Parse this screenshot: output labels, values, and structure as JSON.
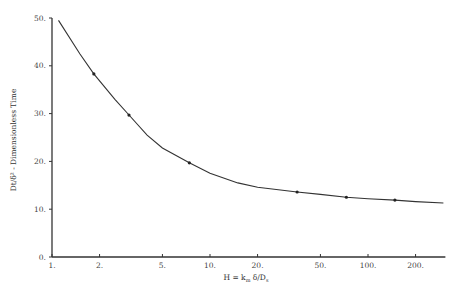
{
  "chart_data": {
    "type": "line",
    "title": "",
    "xlabel": "H = k_m δ/D_s",
    "ylabel": "Dt/δ² - Dimensionless Time",
    "xscale": "log",
    "xlim": [
      1,
      300
    ],
    "ylim": [
      0,
      50
    ],
    "x_ticks": [
      "1.",
      "2.",
      "5.",
      "10.",
      "20.",
      "50.",
      "100.",
      "200."
    ],
    "y_ticks": [
      "0.",
      "10.",
      "20.",
      "30.",
      "40.",
      "50."
    ],
    "grid": false,
    "legend": null,
    "series": [
      {
        "name": "fitted curve",
        "style": "line",
        "x": [
          1.1,
          1.5,
          1.84,
          2.5,
          3.07,
          4.0,
          5.0,
          7.4,
          10,
          15,
          20,
          35.6,
          50,
          73,
          100,
          148,
          200,
          300
        ],
        "y": [
          49.5,
          42.5,
          38.3,
          33.0,
          29.7,
          25.5,
          22.8,
          19.7,
          17.5,
          15.5,
          14.6,
          13.6,
          13.1,
          12.5,
          12.2,
          11.9,
          11.6,
          11.3
        ]
      },
      {
        "name": "data points",
        "style": "markers",
        "x": [
          1.84,
          3.07,
          7.4,
          35.6,
          73,
          148
        ],
        "y": [
          38.3,
          29.7,
          19.7,
          13.6,
          12.5,
          11.9
        ]
      }
    ]
  },
  "axes": {
    "xlabel": "H = k",
    "xlabel_sub": "m",
    "xlabel_rest": " δ/D",
    "xlabel_sub2": "s",
    "ylabel": "Dt/δ² - Dimensionless Time"
  }
}
